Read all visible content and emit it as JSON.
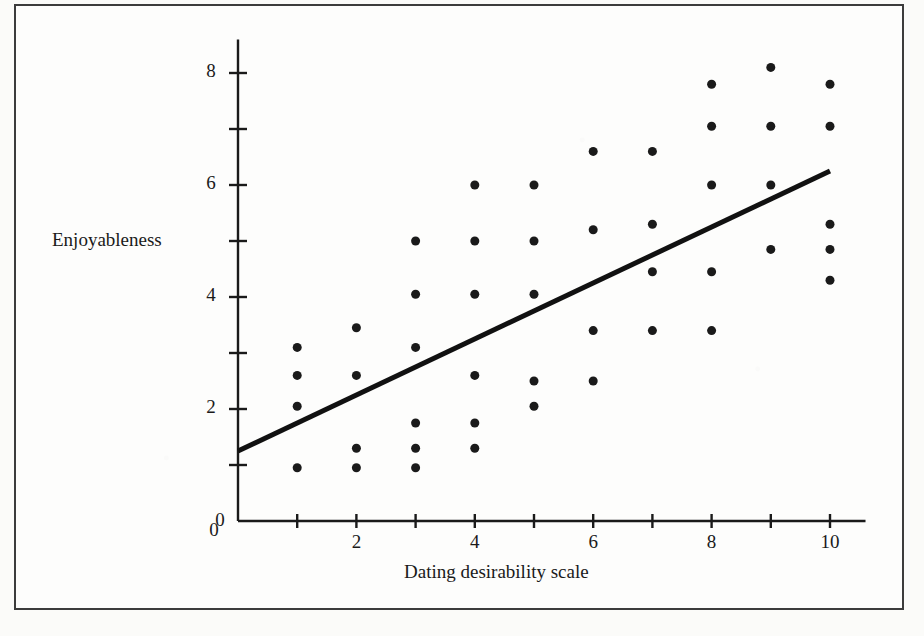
{
  "figure": {
    "background_color": "#fbfbf9",
    "frame_color": "#3c3c3c",
    "ink_color": "#1a1a1a",
    "caption_fragment": ""
  },
  "chart_data": {
    "type": "scatter",
    "title": "",
    "subtitle": "",
    "xlabel": "Dating desirability scale",
    "ylabel": "Enjoyableness",
    "xlim": [
      0,
      10.6
    ],
    "ylim": [
      0,
      8.6
    ],
    "grid": false,
    "legend": null,
    "x_ticks": [
      0,
      1,
      2,
      3,
      4,
      5,
      6,
      7,
      8,
      9,
      10
    ],
    "x_tick_labels": [
      "0",
      "",
      "2",
      "",
      "4",
      "",
      "6",
      "",
      "8",
      "",
      "10"
    ],
    "y_ticks": [
      0,
      1,
      2,
      3,
      4,
      5,
      6,
      7,
      8
    ],
    "y_tick_labels": [
      "0",
      "",
      "2",
      "",
      "4",
      "",
      "6",
      "",
      "8"
    ],
    "marker": "filled-circle",
    "marker_color": "#1a1a1a",
    "marker_size_px": 9,
    "points": [
      {
        "x": 1,
        "y": 3.1
      },
      {
        "x": 1,
        "y": 2.6
      },
      {
        "x": 1,
        "y": 2.05
      },
      {
        "x": 1,
        "y": 0.95
      },
      {
        "x": 2,
        "y": 3.45
      },
      {
        "x": 2,
        "y": 2.6
      },
      {
        "x": 2,
        "y": 1.3
      },
      {
        "x": 2,
        "y": 0.95
      },
      {
        "x": 3,
        "y": 5.0
      },
      {
        "x": 3,
        "y": 4.05
      },
      {
        "x": 3,
        "y": 3.1
      },
      {
        "x": 3,
        "y": 1.75
      },
      {
        "x": 3,
        "y": 1.3
      },
      {
        "x": 3,
        "y": 0.95
      },
      {
        "x": 4,
        "y": 6.0
      },
      {
        "x": 4,
        "y": 5.0
      },
      {
        "x": 4,
        "y": 4.05
      },
      {
        "x": 4,
        "y": 2.6
      },
      {
        "x": 4,
        "y": 1.75
      },
      {
        "x": 4,
        "y": 1.3
      },
      {
        "x": 5,
        "y": 6.0
      },
      {
        "x": 5,
        "y": 5.0
      },
      {
        "x": 5,
        "y": 4.05
      },
      {
        "x": 5,
        "y": 2.5
      },
      {
        "x": 5,
        "y": 2.05
      },
      {
        "x": 6,
        "y": 6.6
      },
      {
        "x": 6,
        "y": 5.2
      },
      {
        "x": 6,
        "y": 3.4
      },
      {
        "x": 6,
        "y": 2.5
      },
      {
        "x": 7,
        "y": 6.6
      },
      {
        "x": 7,
        "y": 5.3
      },
      {
        "x": 7,
        "y": 4.45
      },
      {
        "x": 7,
        "y": 3.4
      },
      {
        "x": 8,
        "y": 7.8
      },
      {
        "x": 8,
        "y": 7.05
      },
      {
        "x": 8,
        "y": 6.0
      },
      {
        "x": 8,
        "y": 4.45
      },
      {
        "x": 8,
        "y": 3.4
      },
      {
        "x": 9,
        "y": 8.1
      },
      {
        "x": 9,
        "y": 7.05
      },
      {
        "x": 9,
        "y": 6.0
      },
      {
        "x": 9,
        "y": 4.85
      },
      {
        "x": 10,
        "y": 7.8
      },
      {
        "x": 10,
        "y": 7.05
      },
      {
        "x": 10,
        "y": 5.3
      },
      {
        "x": 10,
        "y": 4.85
      },
      {
        "x": 10,
        "y": 4.3
      }
    ],
    "trend_line": {
      "style": "solid",
      "color": "#111111",
      "width_px": 5,
      "x_start": 0,
      "y_start": 1.25,
      "x_end": 10,
      "y_end": 6.25
    }
  }
}
